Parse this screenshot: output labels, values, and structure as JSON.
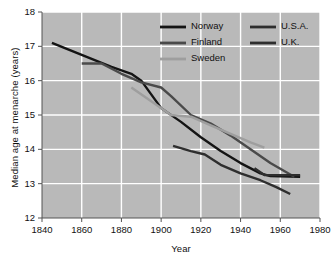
{
  "chart_data": {
    "type": "line",
    "title": "",
    "xlabel": "Year",
    "ylabel": "Median age at menarche (years)",
    "xlim": [
      1840,
      1980
    ],
    "ylim": [
      12,
      18
    ],
    "xticks": [
      1840,
      1860,
      1880,
      1900,
      1920,
      1940,
      1960,
      1980
    ],
    "yticks": [
      12,
      13,
      14,
      15,
      16,
      17,
      18
    ],
    "grid": true,
    "plot_background": "#b9b9b9",
    "gridline_color": "#ffffff",
    "legend_position": "top-right",
    "series": [
      {
        "name": "Norway",
        "color": "#141414",
        "x": [
          1845,
          1860,
          1875,
          1885,
          1890,
          1895,
          1900,
          1910,
          1920,
          1930,
          1940,
          1950,
          1955,
          1970
        ],
        "y": [
          17.1,
          16.75,
          16.4,
          16.2,
          16.0,
          15.6,
          15.2,
          14.8,
          14.35,
          13.95,
          13.6,
          13.3,
          13.22,
          13.2
        ]
      },
      {
        "name": "Finland",
        "color": "#4a4a4a",
        "x": [
          1860,
          1870,
          1880,
          1890,
          1900,
          1905,
          1915,
          1925,
          1935,
          1945,
          1955,
          1967
        ],
        "y": [
          16.5,
          16.5,
          16.2,
          15.95,
          15.8,
          15.55,
          15.0,
          14.75,
          14.4,
          14.0,
          13.6,
          13.2
        ]
      },
      {
        "name": "Sweden",
        "color": "#9e9e9e",
        "x": [
          1885,
          1895,
          1905,
          1915,
          1925,
          1935,
          1945,
          1952
        ],
        "y": [
          15.8,
          15.4,
          15.0,
          14.95,
          14.7,
          14.45,
          14.2,
          14.05
        ]
      },
      {
        "name": "U.S.A.",
        "color": "#2e2e2e",
        "x": [
          1947,
          1952,
          1960,
          1970
        ],
        "y": [
          13.45,
          13.25,
          13.25,
          13.25
        ]
      },
      {
        "name": "U.K.",
        "color": "#2e2e2e",
        "x": [
          1906,
          1915,
          1922,
          1930,
          1940,
          1950,
          1958,
          1965
        ],
        "y": [
          14.1,
          13.95,
          13.85,
          13.55,
          13.3,
          13.1,
          12.9,
          12.7
        ]
      }
    ],
    "legend": [
      {
        "label": "Norway",
        "color": "#141414"
      },
      {
        "label": "U.S.A.",
        "color": "#2e2e2e"
      },
      {
        "label": "Finland",
        "color": "#4a4a4a"
      },
      {
        "label": "U.K.",
        "color": "#2e2e2e"
      },
      {
        "label": "Sweden",
        "color": "#9e9e9e"
      }
    ]
  }
}
